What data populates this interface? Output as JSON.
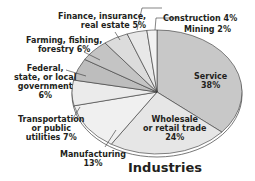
{
  "chart_data": {
    "type": "pie",
    "title": "Industries",
    "categories": [
      "Service",
      "Wholesale or retail trade",
      "Manufacturing",
      "Transportation or public utilities",
      "Federal, state, or local government",
      "Farming, fishing, forestry",
      "Finance, insurance, real estate",
      "Construction",
      "Mining"
    ],
    "values": [
      38,
      24,
      13,
      7,
      6,
      6,
      5,
      4,
      2
    ],
    "unit": "%",
    "colors": [
      "#c8c8c8",
      "#e6e6e6",
      "#f0f0f0",
      "#ebebeb",
      "#bdbdbd",
      "#c4c4c4",
      "#dcdcdc",
      "#e8e8e8",
      "#f2f2f2"
    ]
  },
  "labels": {
    "service": [
      "Service",
      "38%"
    ],
    "wholesale": [
      "Wholesale",
      "or retail trade",
      "24%"
    ],
    "manufacturing": [
      "Manufacturing",
      "13%"
    ],
    "transportation": [
      "Transportation",
      "or public",
      "utilities 7%"
    ],
    "government": [
      "Federal,",
      "state, or local",
      "government",
      "6%"
    ],
    "farming": [
      "Farming, fishing,",
      "forestry 6%"
    ],
    "finance": [
      "Finance, insurance,",
      "real estate 5%"
    ],
    "construction": "Construction 4%",
    "mining": "Mining 2%"
  },
  "title": "Industries"
}
